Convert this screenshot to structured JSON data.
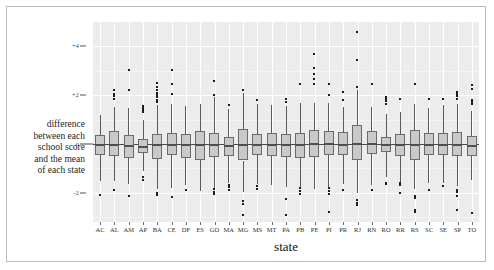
{
  "chart_data": {
    "type": "box",
    "title": "",
    "xlabel": "state",
    "ylabel_lines": [
      "difference",
      "between each",
      "school score",
      "and the mean",
      "of each state"
    ],
    "ylabel_zero_marker": "o",
    "ylim": [
      -3.2,
      5.0
    ],
    "yticks": [
      4,
      2,
      0,
      -2
    ],
    "ytick_labels": [
      "+4",
      "+2",
      "o",
      "-2"
    ],
    "grid": "white gridlines on light gray panel; horizontal at ticks, vertical at each category",
    "legend": "none",
    "categories": [
      "AC",
      "AL",
      "AM",
      "AP",
      "BA",
      "CE",
      "DF",
      "ES",
      "GO",
      "MA",
      "MG",
      "MS",
      "MT",
      "PA",
      "PB",
      "PE",
      "PI",
      "PR",
      "RJ",
      "RN",
      "RO",
      "RR",
      "RS",
      "SC",
      "SE",
      "SP",
      "TO"
    ],
    "boxes": [
      {
        "state": "AC",
        "whisker_low": -1.5,
        "q1": -0.44,
        "median": -0.02,
        "q3": 0.38,
        "whisker_high": 1.18,
        "outliers": [
          -2.1
        ]
      },
      {
        "state": "AL",
        "whisker_low": -1.52,
        "q1": -0.48,
        "median": 0.02,
        "q3": 0.55,
        "whisker_high": 1.52,
        "outliers": [
          1.86,
          1.98,
          2.06,
          2.22,
          -1.88
        ]
      },
      {
        "state": "AM",
        "whisker_low": -1.66,
        "q1": -0.56,
        "median": -0.04,
        "q3": 0.36,
        "whisker_high": 1.48,
        "outliers": [
          2.22,
          3.04,
          -2.12
        ]
      },
      {
        "state": "AP",
        "whisker_low": -1.12,
        "q1": -0.38,
        "median": -0.08,
        "q3": 0.22,
        "whisker_high": 1.0,
        "outliers": [
          1.3,
          1.38,
          1.46,
          1.56,
          -1.36,
          -1.46
        ]
      },
      {
        "state": "BA",
        "whisker_low": -1.86,
        "q1": -0.62,
        "median": 0.0,
        "q3": 0.42,
        "whisker_high": 1.6,
        "outliers": [
          1.72,
          1.82,
          1.92,
          2.02,
          2.1,
          2.2,
          2.34,
          2.52,
          -2.0,
          -2.08
        ]
      },
      {
        "state": "CE",
        "whisker_low": -1.8,
        "q1": -0.46,
        "median": 0.02,
        "q3": 0.44,
        "whisker_high": 1.62,
        "outliers": [
          2.04,
          2.48,
          3.04,
          -2.18
        ]
      },
      {
        "state": "DF",
        "whisker_low": -1.7,
        "q1": -0.56,
        "median": -0.02,
        "q3": 0.4,
        "whisker_high": 1.56,
        "outliers": [
          -1.88
        ]
      },
      {
        "state": "ES",
        "whisker_low": -1.92,
        "q1": -0.66,
        "median": 0.0,
        "q3": 0.52,
        "whisker_high": 1.62,
        "outliers": []
      },
      {
        "state": "GO",
        "whisker_low": -1.8,
        "q1": -0.52,
        "median": 0.0,
        "q3": 0.44,
        "whisker_high": 1.92,
        "outliers": [
          2.0,
          2.6,
          -1.86,
          -1.96,
          -2.04
        ]
      },
      {
        "state": "MA",
        "whisker_low": -1.62,
        "q1": -0.48,
        "median": -0.04,
        "q3": 0.28,
        "whisker_high": 1.42,
        "outliers": [
          1.58,
          -1.7,
          -1.78,
          -1.88
        ]
      },
      {
        "state": "MG",
        "whisker_low": -1.96,
        "q1": -0.68,
        "median": 0.02,
        "q3": 0.62,
        "whisker_high": 2.1,
        "outliers": [
          2.22,
          -2.34,
          -2.44,
          -2.9
        ]
      },
      {
        "state": "MS",
        "whisker_low": -1.64,
        "q1": -0.46,
        "median": 0.0,
        "q3": 0.42,
        "whisker_high": 1.62,
        "outliers": [
          1.82,
          -1.74,
          -1.86
        ]
      },
      {
        "state": "MT",
        "whisker_low": -1.7,
        "q1": -0.5,
        "median": 0.0,
        "q3": 0.44,
        "whisker_high": 1.6,
        "outliers": []
      },
      {
        "state": "PA",
        "whisker_low": -1.76,
        "q1": -0.52,
        "median": -0.02,
        "q3": 0.42,
        "whisker_high": 1.54,
        "outliers": [
          1.74,
          1.86,
          -2.24,
          -2.9
        ]
      },
      {
        "state": "PB",
        "whisker_low": -1.8,
        "q1": -0.58,
        "median": 0.0,
        "q3": 0.46,
        "whisker_high": 1.68,
        "outliers": [
          2.46,
          -1.8,
          -1.92,
          -2.04
        ]
      },
      {
        "state": "PE",
        "whisker_low": -1.84,
        "q1": -0.54,
        "median": 0.04,
        "q3": 0.56,
        "whisker_high": 1.7,
        "outliers": [
          2.48,
          2.66,
          2.86,
          3.1,
          3.7
        ]
      },
      {
        "state": "PI",
        "whisker_low": -1.82,
        "q1": -0.44,
        "median": 0.04,
        "q3": 0.52,
        "whisker_high": 1.68,
        "outliers": [
          2.02,
          2.48,
          -1.82,
          -1.92,
          -2.04,
          -2.8
        ]
      },
      {
        "state": "PR",
        "whisker_low": -1.66,
        "q1": -0.46,
        "median": 0.02,
        "q3": 0.5,
        "whisker_high": 1.5,
        "outliers": [
          1.8,
          2.12,
          -1.88
        ]
      },
      {
        "state": "RJ",
        "whisker_low": -2.02,
        "q1": -0.66,
        "median": 0.06,
        "q3": 0.78,
        "whisker_high": 2.22,
        "outliers": [
          2.34,
          3.46,
          4.58,
          -2.28,
          -2.4,
          -2.52
        ]
      },
      {
        "state": "RN",
        "whisker_low": -1.68,
        "q1": -0.42,
        "median": 0.04,
        "q3": 0.52,
        "whisker_high": 1.52,
        "outliers": [
          2.46,
          -1.88
        ]
      },
      {
        "state": "RO",
        "whisker_low": -1.34,
        "q1": -0.34,
        "median": 0.0,
        "q3": 0.28,
        "whisker_high": 1.22,
        "outliers": [
          1.66,
          1.76,
          1.84,
          1.94,
          -1.58,
          -1.66
        ]
      },
      {
        "state": "RR",
        "whisker_low": -1.6,
        "q1": -0.48,
        "median": -0.02,
        "q3": 0.4,
        "whisker_high": 1.3,
        "outliers": [
          1.86,
          -1.58,
          -1.68,
          -2.0
        ]
      },
      {
        "state": "RS",
        "whisker_low": -1.86,
        "q1": -0.66,
        "median": 0.02,
        "q3": 0.58,
        "whisker_high": 1.66,
        "outliers": [
          2.46,
          -2.12,
          -2.22,
          -2.7,
          -2.8
        ]
      },
      {
        "state": "SC",
        "whisker_low": -1.62,
        "q1": -0.44,
        "median": 0.0,
        "q3": 0.44,
        "whisker_high": 1.48,
        "outliers": [
          1.84,
          -1.88
        ]
      },
      {
        "state": "SE",
        "whisker_low": -1.62,
        "q1": -0.46,
        "median": 0.0,
        "q3": 0.46,
        "whisker_high": 1.58,
        "outliers": [
          1.86,
          -1.74
        ]
      },
      {
        "state": "SP",
        "whisker_low": -1.72,
        "q1": -0.48,
        "median": 0.02,
        "q3": 0.5,
        "whisker_high": 1.62,
        "outliers": [
          1.86,
          1.96,
          2.04,
          2.14,
          -1.88,
          -1.98,
          -2.12,
          -2.7
        ]
      },
      {
        "state": "TO",
        "whisker_low": -1.48,
        "q1": -0.48,
        "median": -0.04,
        "q3": 0.34,
        "whisker_high": 1.36,
        "outliers": [
          1.62,
          1.72,
          1.8,
          2.26,
          2.4,
          -2.82
        ]
      }
    ]
  },
  "colors": {
    "panel_background": "#ececec",
    "gridline": "#ffffff",
    "box_fill": "#c9c9c9",
    "box_border": "#6b6b6b",
    "whisker": "#5a5a5a",
    "median": "#4f4f4f",
    "outlier": "#1c1c1c",
    "zero_line": "#4a4a4a",
    "frame_border": "#b9b9b9",
    "text": "#1d1d1d"
  }
}
